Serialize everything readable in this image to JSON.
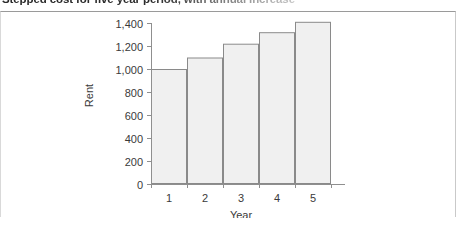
{
  "caption": {
    "text": "Stepped cost for five year period, with annual increase"
  },
  "chart_data": {
    "type": "bar",
    "title": "",
    "categories": [
      "1",
      "2",
      "3",
      "4",
      "5"
    ],
    "values": [
      1000,
      1100,
      1220,
      1320,
      1410
    ],
    "xlabel": "Year",
    "ylabel": "Rent",
    "ylim": [
      0,
      1400
    ],
    "yticks": [
      0,
      200,
      400,
      600,
      800,
      1000,
      1200,
      1400
    ],
    "ytick_labels": [
      "0",
      "200",
      "400",
      "600",
      "800",
      "1,000",
      "1,200",
      "1,400"
    ],
    "xtick_labels": [
      "1",
      "2",
      "3",
      "4",
      "5"
    ],
    "grid": false,
    "legend": null,
    "bar_gap": 0,
    "colors": {
      "bar_fill": "#f0f0f0",
      "bar_edge": "#8a8a8a",
      "axis": "#8f8f8f",
      "text": "#3a3a3a"
    }
  }
}
